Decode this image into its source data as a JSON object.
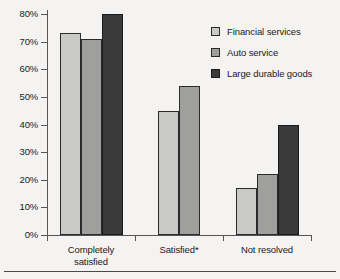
{
  "chart_data": {
    "type": "bar",
    "title": "",
    "subtitle": "",
    "xlabel": "",
    "ylabel": "",
    "categories": [
      "Completely\nsatisfied",
      "Satisfied*",
      "Not resolved"
    ],
    "series": [
      {
        "name": "Financial services",
        "color": "#c9c9c7",
        "values": [
          73,
          45,
          17
        ]
      },
      {
        "name": "Auto service",
        "color": "#9f9f9d",
        "values": [
          71,
          54,
          22
        ]
      },
      {
        "name": "Large durable goods",
        "color": "#3a3a3a",
        "values": [
          80,
          null,
          40
        ]
      }
    ],
    "ylim": [
      0,
      80
    ],
    "ytick_values": [
      0,
      10,
      20,
      30,
      40,
      50,
      60,
      70,
      80
    ],
    "ytick_labels": [
      "0%",
      "10%",
      "20%",
      "30%",
      "40%",
      "50%",
      "60%",
      "70%",
      "80%"
    ],
    "ytick_suffix": "%",
    "grid": false,
    "legend_position": "top-right",
    "legend_entries": [
      "Financial services",
      "Auto service",
      "Large durable goods"
    ],
    "footnote_marker": "*",
    "value_labels_shown": false,
    "background_color": "#f4f3f1",
    "axis_color": "#555555"
  }
}
